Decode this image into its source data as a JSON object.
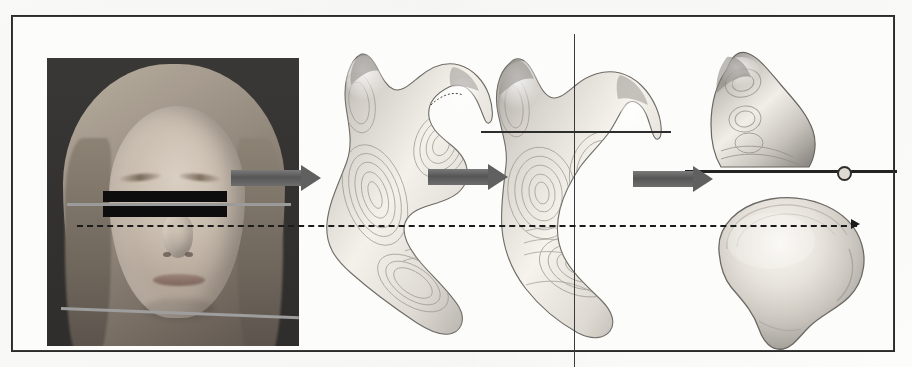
{
  "figure": {
    "caption": "",
    "background_color": "#fcfcfa",
    "frame_color": "#2b2b2b"
  },
  "panels": [
    {
      "id": "panel-photo",
      "name": "patient-photograph",
      "description": "Frontal clinical photograph of a patient with the eyes masked by black censor bars",
      "alt": "patient frontal facial photograph"
    },
    {
      "id": "panel-mandible-oblique",
      "name": "mandible-oblique-view",
      "description": "Three dimensional surface reconstruction of the mandible shown in an oblique orientation with isocontour banding",
      "alt": "3D mandible oblique view"
    },
    {
      "id": "panel-mandible-aligned",
      "name": "mandible-aligned-view",
      "description": "Mandible reoriented and aligned to the reference coordinate crosshair",
      "alt": "3D mandible aligned to reference axes"
    },
    {
      "id": "panel-condyle",
      "name": "condyle-isolated-view",
      "description": "Isolated condylar process sectioned at the horizontal cut plane",
      "alt": "isolated mandibular condyle"
    },
    {
      "id": "panel-condyle-section",
      "name": "condyle-cross-section",
      "description": "Superior cross sectional surface of the resected condylar head",
      "alt": "condyle head cross section"
    }
  ],
  "annotations": {
    "arrows": [
      {
        "name": "arrow-photo-to-mandible",
        "label": "",
        "color": "#606060"
      },
      {
        "name": "arrow-mandible-to-aligned",
        "label": "",
        "color": "#606060"
      },
      {
        "name": "arrow-aligned-to-condyle",
        "label": "",
        "color": "#606060"
      }
    ],
    "lines": [
      {
        "name": "interpupillary-reference-line",
        "label": "",
        "style": "solid",
        "color": "#9b9b9b"
      },
      {
        "name": "mandibular-plane-reference-line",
        "label": "",
        "style": "solid",
        "color": "#9e9e9e"
      },
      {
        "name": "horizontal-registration-line",
        "label": "",
        "style": "dashed",
        "color": "#1c1c1c"
      },
      {
        "name": "axial-crosshair-line",
        "label": "",
        "style": "solid",
        "color": "#2d2d2d"
      },
      {
        "name": "vertical-panel-divider",
        "label": "",
        "style": "solid",
        "color": "#3a3a3a"
      },
      {
        "name": "condyle-cut-plane-line",
        "label": "",
        "style": "solid",
        "color": "#232323"
      }
    ],
    "markers": [
      {
        "name": "cut-plane-node",
        "label": "",
        "color": "#2e2e2e"
      }
    ],
    "censor_bars": [
      {
        "name": "eye-censor-bar-upper",
        "label": "",
        "color": "#0d0d0d"
      },
      {
        "name": "eye-censor-bar-lower",
        "label": "",
        "color": "#0d0d0d"
      }
    ]
  }
}
